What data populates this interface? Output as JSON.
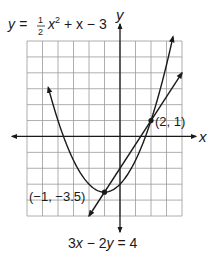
{
  "chart_data": {
    "type": "line",
    "title": "",
    "xlabel": "x",
    "ylabel": "y",
    "xlim": [
      -6,
      4
    ],
    "ylim": [
      -5,
      6
    ],
    "grid": true,
    "series": [
      {
        "name": "parabola",
        "equation": "y = 1/2 x^2 + x - 3",
        "x": [
          -4.6,
          -4,
          -3,
          -2,
          -1,
          0,
          1,
          2,
          3,
          3.4
        ],
        "values": [
          4.98,
          1,
          -1.5,
          -3,
          -3.5,
          -3,
          -1.5,
          1,
          4.5,
          6.18
        ]
      },
      {
        "name": "line",
        "equation": "3x - 2y = 4",
        "x": [
          -2,
          -1,
          0,
          2,
          4
        ],
        "values": [
          -5,
          -3.5,
          -2,
          1,
          4
        ]
      }
    ],
    "points": [
      {
        "label": "(2, 1)",
        "x": 2,
        "y": 1
      },
      {
        "label": "(-1, -3.5)",
        "x": -1,
        "y": -3.5
      }
    ]
  },
  "labels": {
    "parabola_eq": "y = ½x² + x − 3",
    "parabola_y": "y = ",
    "parabola_frac_num": "1",
    "parabola_frac_den": "2",
    "parabola_x": "x",
    "parabola_sup": "2",
    "parabola_rest": " + x − 3",
    "line_eq_parts": [
      "3",
      "x",
      " − 2",
      "y",
      " = 4"
    ],
    "point_a": "(2, 1)",
    "point_b": "(−1, −3.5)",
    "x_axis": "x",
    "y_axis": "y"
  }
}
